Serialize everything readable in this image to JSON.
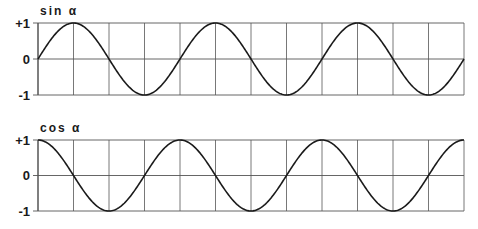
{
  "chart_data": [
    {
      "type": "line",
      "title": "sin α",
      "function": "sin",
      "periods": 3,
      "x_divisions": 12,
      "yticks": [
        "+1",
        "0",
        "-1"
      ],
      "ylim": [
        -1,
        1
      ],
      "grid": true,
      "x": [
        0,
        90,
        180,
        270,
        360,
        450,
        540,
        630,
        720,
        810,
        900,
        990,
        1080
      ],
      "values": [
        0,
        1,
        0,
        -1,
        0,
        1,
        0,
        -1,
        0,
        1,
        0,
        -1,
        0
      ]
    },
    {
      "type": "line",
      "title": "cos α",
      "function": "cos",
      "periods": 3,
      "x_divisions": 12,
      "yticks": [
        "+1",
        "0",
        "-1"
      ],
      "ylim": [
        -1,
        1
      ],
      "grid": true,
      "x": [
        0,
        90,
        180,
        270,
        360,
        450,
        540,
        630,
        720,
        810,
        900,
        990,
        1080
      ],
      "values": [
        1,
        0,
        -1,
        0,
        1,
        0,
        -1,
        0,
        1,
        0,
        -1,
        0,
        1
      ]
    }
  ],
  "colors": {
    "line": "#1a1a1a",
    "grid": "#555555"
  }
}
